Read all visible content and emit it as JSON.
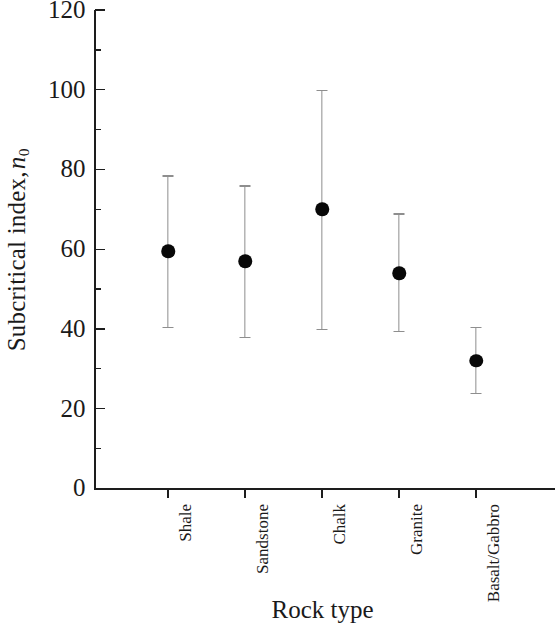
{
  "chart_data": {
    "type": "scatter",
    "title": "",
    "xlabel": "Rock type",
    "ylabel_parts": {
      "text": "Subcritical index,",
      "symbol": "n",
      "subscript": "0"
    },
    "ylabel": "Subcritical index, n0",
    "categories": [
      "Shale",
      "Sandstone",
      "Chalk",
      "Granite",
      "Basalt/Gabbro"
    ],
    "values": [
      59.5,
      57,
      70,
      54,
      32
    ],
    "error_low": [
      40.5,
      38,
      40,
      39.5,
      24
    ],
    "error_high": [
      78.5,
      76,
      100,
      69,
      40.5
    ],
    "series": [
      {
        "name": "Subcritical index",
        "points": [
          {
            "category": "Shale",
            "value": 59.5,
            "low": 40.5,
            "high": 78.5
          },
          {
            "category": "Sandstone",
            "value": 57,
            "low": 38,
            "high": 76
          },
          {
            "category": "Chalk",
            "value": 70,
            "low": 40,
            "high": 100
          },
          {
            "category": "Granite",
            "value": 54,
            "low": 39.5,
            "high": 69
          },
          {
            "category": "Basalt/Gabbro",
            "value": 32,
            "low": 24,
            "high": 40.5
          }
        ]
      }
    ],
    "ylim": [
      0,
      120
    ],
    "ytick_major": [
      0,
      20,
      40,
      60,
      80,
      100,
      120
    ],
    "ytick_major_labels": [
      "0",
      "20",
      "40",
      "60",
      "80",
      "100",
      "120"
    ],
    "ytick_minor": [
      10,
      30,
      50,
      70,
      90,
      110
    ],
    "grid": false,
    "legend": "none",
    "marker_color": "#080808",
    "errorbar_color": "#8e8e8e",
    "axis_color": "#1d1d1d"
  }
}
